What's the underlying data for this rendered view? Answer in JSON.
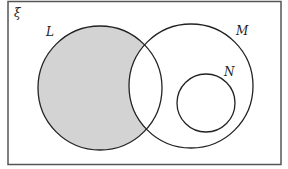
{
  "diagram": {
    "type": "venn",
    "universal_set_label": "ξ",
    "sets": [
      {
        "name": "L",
        "label": "L",
        "shaded": "L only (L excluding M)"
      },
      {
        "name": "M",
        "label": "M"
      },
      {
        "name": "N",
        "label": "N",
        "relation": "N is a subset of M, disjoint from L"
      }
    ],
    "shaded_region": "L ∩ M'",
    "colors": {
      "shade": "#d3d3d3",
      "stroke": "#222222",
      "frame": "#555555",
      "background": "#ffffff"
    }
  }
}
